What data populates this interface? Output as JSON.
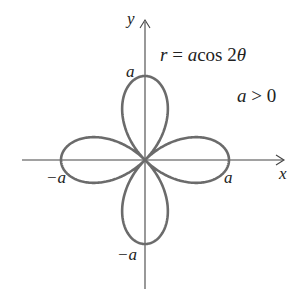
{
  "chart_data": {
    "type": "line",
    "subtype": "polar-curve",
    "title": "",
    "equation": "r = a cos 2θ",
    "condition": "a > 0",
    "xlabel": "x",
    "ylabel": "y",
    "tick_labels": {
      "x_positive": "a",
      "x_negative": "−a",
      "y_positive": "a",
      "y_negative": "−a"
    },
    "curve": {
      "name": "four-leaved rose",
      "polar_function": "r = a*cos(2*theta)",
      "theta_range": [
        0,
        6.283185
      ],
      "a": 1,
      "petal_tips": [
        [
          1,
          0
        ],
        [
          0,
          1
        ],
        [
          -1,
          0
        ],
        [
          0,
          -1
        ]
      ],
      "color": "#6b6b6b"
    },
    "xlim": [
      -1.0,
      1.7
    ],
    "ylim": [
      -1.55,
      1.7
    ],
    "grid": false,
    "legend": null
  },
  "labels": {
    "y_axis": "y",
    "x_axis": "x",
    "eq_r": "r",
    "eq_equals": " = ",
    "eq_a": "a",
    "eq_cos": "cos 2",
    "eq_theta": "θ",
    "cond_a": "a",
    "cond_rest": " > 0",
    "tick_top": "a",
    "tick_right": "a",
    "tick_left": "−a",
    "tick_bottom": "−a"
  }
}
